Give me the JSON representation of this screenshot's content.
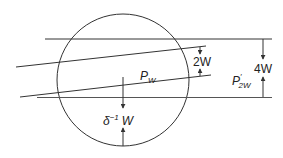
{
  "diagram": {
    "labels": {
      "region_label": "P",
      "region_sub": "W",
      "gap_label": "2W",
      "total_label": "4W",
      "outer_label": "P",
      "outer_prime": "′",
      "outer_sub": "2W",
      "offset_delta": "δ",
      "offset_exp": "−1",
      "offset_w": "W"
    },
    "colors": {
      "stroke": "#333333",
      "text": "#222222",
      "background": "#ffffff"
    }
  }
}
